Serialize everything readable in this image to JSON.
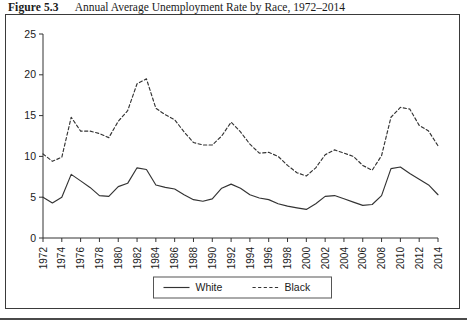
{
  "caption": {
    "figure_number": "Figure 5.3",
    "title": "Annual Average Unemployment Rate by Race, 1972–2014"
  },
  "chart_data": {
    "type": "line",
    "title": "Annual Average Unemployment Rate by Race, 1972–2014",
    "xlabel": "",
    "ylabel": "",
    "xlim": [
      1972,
      2014
    ],
    "ylim": [
      0,
      25
    ],
    "yticks": [
      0,
      5,
      10,
      15,
      20,
      25
    ],
    "ytick_labels": [
      "0",
      "5",
      "10",
      "15",
      "20",
      "25"
    ],
    "xticks": [
      1972,
      1974,
      1976,
      1978,
      1980,
      1982,
      1984,
      1986,
      1988,
      1990,
      1992,
      1994,
      1996,
      1998,
      2000,
      2002,
      2004,
      2006,
      2008,
      2010,
      2012,
      2014
    ],
    "xtick_labels": [
      "1972",
      "1974",
      "1976",
      "1978",
      "1980",
      "1982",
      "1984",
      "1986",
      "1988",
      "1990",
      "1992",
      "1994",
      "1996",
      "1998",
      "2000",
      "2002",
      "2004",
      "2006",
      "2008",
      "2010",
      "2012",
      "2014"
    ],
    "grid": false,
    "legend_position": "bottom-center",
    "x": [
      1972,
      1973,
      1974,
      1975,
      1976,
      1977,
      1978,
      1979,
      1980,
      1981,
      1982,
      1983,
      1984,
      1985,
      1986,
      1987,
      1988,
      1989,
      1990,
      1991,
      1992,
      1993,
      1994,
      1995,
      1996,
      1997,
      1998,
      1999,
      2000,
      2001,
      2002,
      2003,
      2004,
      2005,
      2006,
      2007,
      2008,
      2009,
      2010,
      2011,
      2012,
      2013,
      2014
    ],
    "series": [
      {
        "name": "White",
        "style": "solid",
        "color": "#333333",
        "values": [
          5.0,
          4.3,
          5.0,
          7.8,
          7.0,
          6.2,
          5.2,
          5.1,
          6.3,
          6.7,
          8.6,
          8.4,
          6.5,
          6.2,
          6.0,
          5.3,
          4.7,
          4.5,
          4.8,
          6.1,
          6.6,
          6.1,
          5.3,
          4.9,
          4.7,
          4.2,
          3.9,
          3.7,
          3.5,
          4.2,
          5.1,
          5.2,
          4.8,
          4.4,
          4.0,
          4.1,
          5.2,
          8.5,
          8.7,
          7.9,
          7.2,
          6.5,
          5.3
        ]
      },
      {
        "name": "Black",
        "style": "dashed",
        "color": "#333333",
        "values": [
          10.3,
          9.4,
          9.9,
          14.8,
          13.1,
          13.1,
          12.8,
          12.3,
          14.3,
          15.6,
          18.9,
          19.5,
          15.9,
          15.1,
          14.5,
          13.0,
          11.7,
          11.4,
          11.4,
          12.5,
          14.2,
          13.0,
          11.5,
          10.4,
          10.5,
          10.0,
          8.9,
          8.0,
          7.6,
          8.6,
          10.2,
          10.8,
          10.4,
          10.0,
          8.9,
          8.3,
          10.1,
          14.8,
          16.0,
          15.8,
          13.8,
          13.1,
          11.3
        ]
      }
    ],
    "legend": [
      {
        "label": "White",
        "style": "solid"
      },
      {
        "label": "Black",
        "style": "dashed"
      }
    ]
  }
}
